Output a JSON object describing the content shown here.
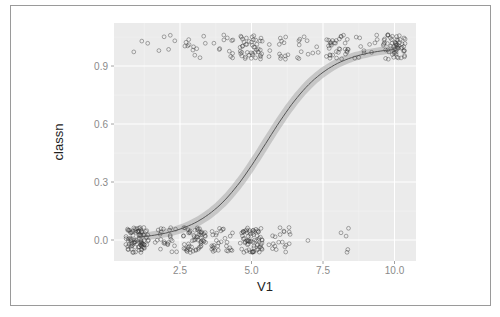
{
  "chart_data": {
    "type": "scatter",
    "title": "",
    "xlabel": "V1",
    "ylabel": "classn",
    "xlim": [
      0.2,
      10.75
    ],
    "ylim": [
      -0.11,
      1.12
    ],
    "x_ticks": [
      2.5,
      5.0,
      7.5,
      10.0
    ],
    "x_tick_labels": [
      "2.5",
      "5.0",
      "7.5",
      "10.0"
    ],
    "y_ticks": [
      0.0,
      0.3,
      0.6,
      0.9
    ],
    "y_tick_labels": [
      "0.0",
      "0.3",
      "0.6",
      "0.9"
    ],
    "grid": true,
    "legend": "none",
    "points_note": "jittered binary outcome (classn 0/1) vs integer V1 1-10; approximate counts per V1 value",
    "series": [
      {
        "name": "classn = 0 (jittered)",
        "kind": "points",
        "x": [
          1,
          2,
          3,
          4,
          5,
          6,
          7,
          8
        ],
        "counts": [
          90,
          25,
          60,
          30,
          70,
          20,
          1,
          5
        ],
        "y": 0
      },
      {
        "name": "classn = 1 (jittered)",
        "kind": "points",
        "x": [
          1,
          2,
          3,
          4,
          5,
          6,
          7,
          8,
          9,
          10
        ],
        "counts": [
          3,
          5,
          12,
          12,
          45,
          14,
          12,
          35,
          12,
          60
        ],
        "y": 1
      },
      {
        "name": "logistic fit",
        "kind": "line",
        "intercept": -5.17,
        "slope": 0.94,
        "x": [
          1,
          2,
          3,
          4,
          5,
          5.5,
          6,
          7,
          8,
          9,
          10
        ],
        "values": [
          0.014,
          0.035,
          0.083,
          0.191,
          0.388,
          0.5,
          0.62,
          0.81,
          0.92,
          0.97,
          0.987
        ],
        "ci_band_halfwidth": 0.035
      }
    ]
  },
  "colors": {
    "panel_bg": "#ebebeb",
    "grid_major": "#ffffff",
    "grid_minor": "#f4f4f4",
    "point_stroke": "#333333",
    "line": "#555555",
    "ribbon": "#a8a8a8"
  }
}
